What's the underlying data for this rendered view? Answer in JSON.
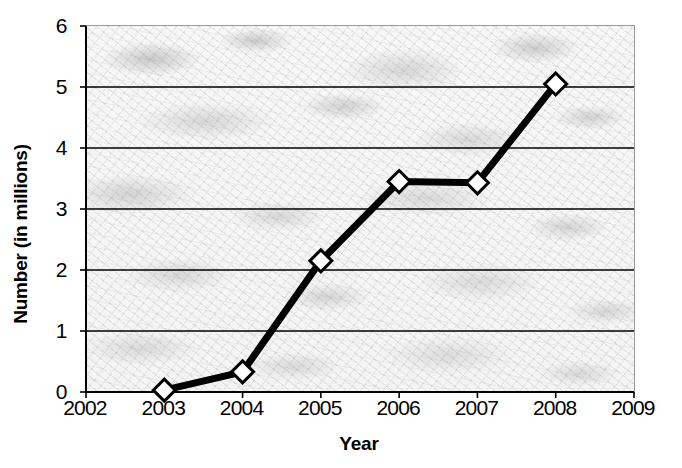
{
  "chart_data": {
    "type": "line",
    "title": "",
    "subtitle": "",
    "xlabel": "Year",
    "ylabel": "Number (in millions)",
    "x": [
      2003,
      2004,
      2005,
      2006,
      2007,
      2008
    ],
    "values": [
      0.03,
      0.33,
      2.15,
      3.45,
      3.43,
      5.05
    ],
    "series": [
      {
        "name": "Number (in millions)",
        "x": [
          2003,
          2004,
          2005,
          2006,
          2007,
          2008
        ],
        "values": [
          0.03,
          0.33,
          2.15,
          3.45,
          3.43,
          5.05
        ]
      }
    ],
    "xlim": [
      2002,
      2009
    ],
    "ylim": [
      0,
      6
    ],
    "x_ticks": [
      2002,
      2003,
      2004,
      2005,
      2006,
      2007,
      2008,
      2009
    ],
    "x_tick_labels": [
      "2002",
      "2003",
      "2004",
      "2005",
      "2006",
      "2007",
      "2008",
      "2009"
    ],
    "y_ticks": [
      0,
      1,
      2,
      3,
      4,
      5,
      6
    ],
    "y_tick_labels": [
      "0",
      "1",
      "2",
      "3",
      "4",
      "5",
      "6"
    ],
    "grid": "horizontal",
    "legend": "none",
    "marker": "diamond",
    "marker_fill_color": "#ffffff",
    "line_color": "#000000",
    "gridline_color": "#000000",
    "plot_background": "#f2f2f2",
    "plot_border_color": "#9a9a9a",
    "annotations": []
  },
  "axes": {
    "y_title": "Number (in millions)",
    "x_title": "Year"
  }
}
